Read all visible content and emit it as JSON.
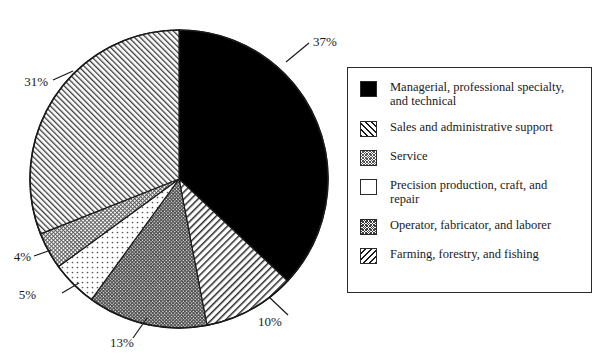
{
  "chart_data": {
    "type": "pie",
    "title": "",
    "subtitle": "",
    "xlabel": "",
    "ylabel": "",
    "legend_position": "right",
    "grid": false,
    "start_angle_deg": 90,
    "direction": "clockwise",
    "categories": [
      "Managerial, professional specialty, and technical",
      "Sales and administrative support",
      "Service",
      "Precision production, craft, and repair",
      "Operator, fabricator, and laborer",
      "Farming, forestry, and fishing"
    ],
    "values": [
      37,
      10,
      4,
      5,
      13,
      31
    ],
    "value_labels": [
      "37%",
      "10%",
      "4%",
      "5%",
      "13%",
      "31%"
    ],
    "slices": [
      {
        "label": "Managerial, professional specialty, and technical",
        "value": 37,
        "value_label": "37%",
        "pattern": "solid-black",
        "order": 1
      },
      {
        "label": "Sales and administrative support",
        "value": 10,
        "value_label": "10%",
        "pattern": "forward-diagonal-hatch",
        "order": 2
      },
      {
        "label": "Operator, fabricator, and laborer",
        "value": 13,
        "value_label": "13%",
        "pattern": "dense-cross-hatch",
        "order": 3
      },
      {
        "label": "Precision production, craft, and repair",
        "value": 5,
        "value_label": "5%",
        "pattern": "sparse-dots",
        "order": 4
      },
      {
        "label": "Service",
        "value": 4,
        "value_label": "4%",
        "pattern": "fine-cross-hatch",
        "order": 5
      },
      {
        "label": "Farming, forestry, and fishing",
        "value": 31,
        "value_label": "31%",
        "pattern": "backward-diagonal-hatch",
        "order": 6
      }
    ],
    "colors": {
      "outline": "#1a1a1a",
      "solid_fill": "#000000",
      "background": "#ffffff",
      "text": "#1a1a1a"
    }
  },
  "legend": {
    "items": [
      {
        "label": "Managerial, professional specialty,\nand technical",
        "swatch": "solid-black-swatch"
      },
      {
        "label": "Sales and administrative support",
        "swatch": "forward-hatch-swatch"
      },
      {
        "label": "Service",
        "swatch": "fine-cross-hatch-swatch"
      },
      {
        "label": "Precision production, craft, and\nrepair",
        "swatch": "sparse-dots-swatch"
      },
      {
        "label": "Operator, fabricator, and laborer",
        "swatch": "dense-cross-hatch-swatch"
      },
      {
        "label": "Farming, forestry, and fishing",
        "swatch": "backward-hatch-swatch"
      }
    ]
  },
  "pie_labels": {
    "p37": "37%",
    "p10": "10%",
    "p13": "13%",
    "p5": "5%",
    "p4": "4%",
    "p31": "31%"
  }
}
